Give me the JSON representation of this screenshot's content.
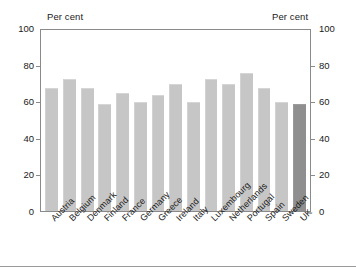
{
  "chart_data": {
    "type": "bar",
    "title": "",
    "xlabel": "",
    "ylabel": "Per cent",
    "ylim": [
      0,
      100
    ],
    "yticks": [
      0,
      20,
      40,
      60,
      80,
      100
    ],
    "grid": false,
    "legend": null,
    "axis_captions": {
      "left": "Per cent",
      "right": "Per cent"
    },
    "categories": [
      "Austria",
      "Belgium",
      "Denmark",
      "Finland",
      "France",
      "Germany",
      "Greece",
      "Ireland",
      "Italy",
      "Luxembourg",
      "Netherlands",
      "Portugal",
      "Spain",
      "Sweden",
      "UK"
    ],
    "values": [
      68,
      73,
      68,
      59,
      65,
      60,
      64,
      70,
      60,
      73,
      70,
      76,
      68,
      60,
      59
    ],
    "highlight_category": "UK",
    "colors": {
      "bar": "#c6c6c6",
      "bar_highlight": "#8f8f8f",
      "frame": "#8a8a8a",
      "text": "#1a1a1a"
    },
    "right_axis_yticks": [
      0,
      20,
      40,
      60,
      80,
      100
    ]
  }
}
